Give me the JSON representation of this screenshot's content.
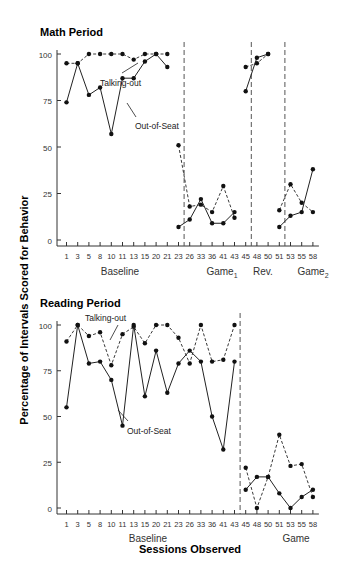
{
  "chart_data": [
    {
      "type": "line",
      "title": "Math Period",
      "ylabel": "Percentage of Intervals Scored for Behavior",
      "xlabel": "Sessions Observed",
      "ylim": [
        0,
        100
      ],
      "yticks": [
        0,
        25,
        50,
        75,
        100
      ],
      "xticks": [
        "1",
        "3",
        "5",
        "8",
        "10",
        "11",
        "13",
        "15",
        "20",
        "21",
        "23",
        "26",
        "33",
        "36",
        "41",
        "43",
        "45",
        "48",
        "50",
        "51",
        "53",
        "55",
        "58"
      ],
      "phases": [
        {
          "label": "Baseline",
          "sessions": [
            "1",
            "3",
            "5",
            "8",
            "10",
            "11",
            "13",
            "15",
            "20",
            "21"
          ]
        },
        {
          "label": "Game",
          "subscript": "1",
          "sessions": [
            "23",
            "26",
            "33",
            "36",
            "41",
            "43"
          ]
        },
        {
          "label": "Rev.",
          "sessions": [
            "45",
            "48",
            "50"
          ]
        },
        {
          "label": "Game",
          "subscript": "2",
          "sessions": [
            "51",
            "53",
            "55",
            "58"
          ]
        }
      ],
      "annotations": [
        "Talking-out",
        "Out-of-Seat"
      ],
      "series": [
        {
          "name": "Talking-out",
          "style": "dashed",
          "phases": [
            [
              95,
              95,
              100,
              100,
              100,
              100,
              97,
              100,
              100,
              100
            ],
            [
              51,
              18,
              19,
              15,
              29,
              12
            ],
            [
              93,
              95,
              100
            ],
            [
              16,
              30,
              20,
              15
            ]
          ]
        },
        {
          "name": "Out-of-Seat",
          "style": "solid",
          "phases": [
            [
              74,
              95,
              78,
              82,
              57,
              87,
              87,
              96,
              100,
              93
            ],
            [
              7,
              11,
              22,
              9,
              9,
              15
            ],
            [
              80,
              98,
              100
            ],
            [
              7,
              13,
              15,
              38
            ]
          ]
        }
      ]
    },
    {
      "type": "line",
      "title": "Reading Period",
      "ylabel": "Percentage of Intervals Scored for Behavior",
      "xlabel": "Sessions Observed",
      "ylim": [
        0,
        100
      ],
      "yticks": [
        0,
        25,
        50,
        75,
        100
      ],
      "xticks": [
        "1",
        "3",
        "5",
        "8",
        "10",
        "11",
        "13",
        "15",
        "20",
        "21",
        "23",
        "26",
        "33",
        "36",
        "41",
        "43",
        "45",
        "48",
        "50",
        "51",
        "53",
        "55",
        "58"
      ],
      "phases": [
        {
          "label": "Baseline",
          "sessions": [
            "1",
            "3",
            "5",
            "8",
            "10",
            "11",
            "13",
            "15",
            "20",
            "21",
            "23",
            "26",
            "33",
            "36",
            "41",
            "43"
          ]
        },
        {
          "label": "Game",
          "sessions": [
            "45",
            "48",
            "50",
            "51",
            "53",
            "55",
            "58"
          ]
        }
      ],
      "annotations": [
        "Talking-out",
        "Out-of-Seat"
      ],
      "series": [
        {
          "name": "Talking-out",
          "style": "dashed",
          "phases": [
            [
              91,
              100,
              94,
              96,
              78,
              95,
              99,
              90,
              100,
              100,
              93,
              79,
              100,
              80,
              81,
              100
            ],
            [
              22,
              0,
              17,
              40,
              23,
              24,
              6
            ]
          ]
        },
        {
          "name": "Out-of-Seat",
          "style": "solid",
          "phases": [
            [
              55,
              100,
              79,
              80,
              70,
              45,
              100,
              61,
              86,
              63,
              79,
              86,
              80,
              50,
              32,
              80
            ],
            [
              10,
              17,
              17,
              8,
              0,
              6,
              10
            ]
          ]
        }
      ]
    }
  ],
  "labels": {
    "math_title": "Math Period",
    "reading_title": "Reading Period",
    "ylabel": "Percentage of Intervals Scored for Behavior",
    "xlabel": "Sessions Observed",
    "talking_out": "Talking-out",
    "out_of_seat": "Out-of-Seat",
    "baseline": "Baseline",
    "game": "Game",
    "sub1": "1",
    "sub2": "2",
    "rev": "Rev."
  }
}
